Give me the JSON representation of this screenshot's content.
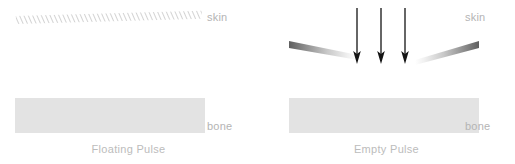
{
  "figure": {
    "background_color": "#ffffff",
    "colors": {
      "bone_fill": "#e3e3e3",
      "label_text": "#b4b4b4",
      "caption_text": "#bcbcbc",
      "arrow": "#141414",
      "hatch_line": "#c9c9c9",
      "wedge_dark": "#6e6e6e",
      "wedge_light": "#ffffff"
    }
  },
  "panels": [
    {
      "id": "floating-pulse",
      "caption": "Floating Pulse",
      "skin_label": "skin",
      "bone_label": "bone",
      "skin_style": "continuous-hatched-band",
      "arrows": [],
      "wedges": []
    },
    {
      "id": "empty-pulse",
      "caption": "Empty Pulse",
      "skin_label": "skin",
      "bone_label": "bone",
      "skin_style": "broken-gradient-wedges",
      "arrows": [
        {
          "label": "pressure-arrow-1"
        },
        {
          "label": "pressure-arrow-2"
        },
        {
          "label": "pressure-arrow-3"
        }
      ],
      "wedges": [
        {
          "label": "skin-wedge-left"
        },
        {
          "label": "skin-wedge-right"
        }
      ]
    }
  ]
}
